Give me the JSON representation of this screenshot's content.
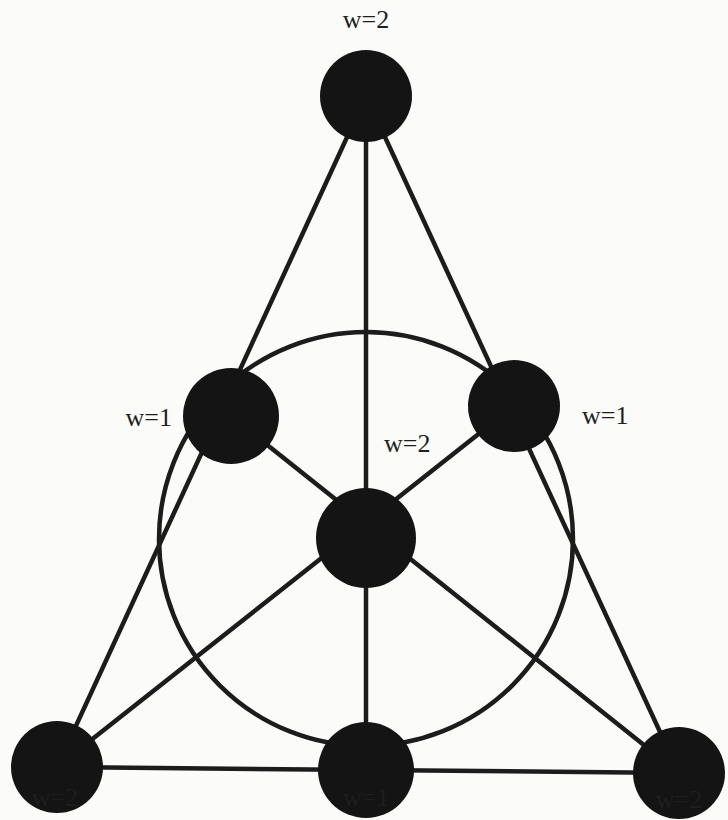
{
  "diagram": {
    "type": "fano-plane",
    "colors": {
      "node_fill": "#141414",
      "edge_stroke": "#1c1c1c",
      "label": "#1e1e1e",
      "background": "#fbfbfa"
    },
    "nodes": [
      {
        "id": "top",
        "label": "w=2"
      },
      {
        "id": "left-mid",
        "label": "w=1"
      },
      {
        "id": "right-mid",
        "label": "w=1"
      },
      {
        "id": "center",
        "label": "w=2"
      },
      {
        "id": "bottom-left",
        "label": "w=2"
      },
      {
        "id": "bottom-mid",
        "label": "w=1"
      },
      {
        "id": "bottom-right",
        "label": "w=2"
      }
    ],
    "lines": [
      {
        "id": "left-side",
        "nodes": [
          "top",
          "left-mid",
          "bottom-left"
        ]
      },
      {
        "id": "right-side",
        "nodes": [
          "top",
          "right-mid",
          "bottom-right"
        ]
      },
      {
        "id": "base",
        "nodes": [
          "bottom-left",
          "bottom-mid",
          "bottom-right"
        ]
      },
      {
        "id": "median-vertical",
        "nodes": [
          "top",
          "center",
          "bottom-mid"
        ]
      },
      {
        "id": "median-left",
        "nodes": [
          "left-mid",
          "center",
          "bottom-right"
        ]
      },
      {
        "id": "median-right",
        "nodes": [
          "right-mid",
          "center",
          "bottom-left"
        ]
      },
      {
        "id": "inner-circle",
        "nodes": [
          "left-mid",
          "right-mid",
          "bottom-mid"
        ],
        "shape": "circle"
      }
    ]
  }
}
